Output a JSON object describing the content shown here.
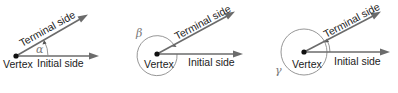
{
  "diagram": {
    "colors": {
      "ray": "#6b6b6b",
      "arc": "#8a8a8a",
      "text": "#222222",
      "greek": "#777777",
      "vertex": "#111111"
    },
    "angles": [
      {
        "id": "alpha",
        "symbol": "α",
        "vertex_label": "Vertex",
        "initial_label": "Initial side",
        "terminal_label": "Terminal side",
        "direction": "counterclockwise",
        "description": "acute positive angle"
      },
      {
        "id": "beta",
        "symbol": "β",
        "vertex_label": "Vertex",
        "initial_label": "Initial side",
        "terminal_label": "Terminal side",
        "direction": "clockwise",
        "description": "negative angle drawn clockwise (nearly full turn)"
      },
      {
        "id": "gamma",
        "symbol": "γ",
        "vertex_label": "Vertex",
        "initial_label": "Initial side",
        "terminal_label": "Terminal side",
        "direction": "counterclockwise",
        "description": "angle greater than one full rotation"
      }
    ]
  }
}
